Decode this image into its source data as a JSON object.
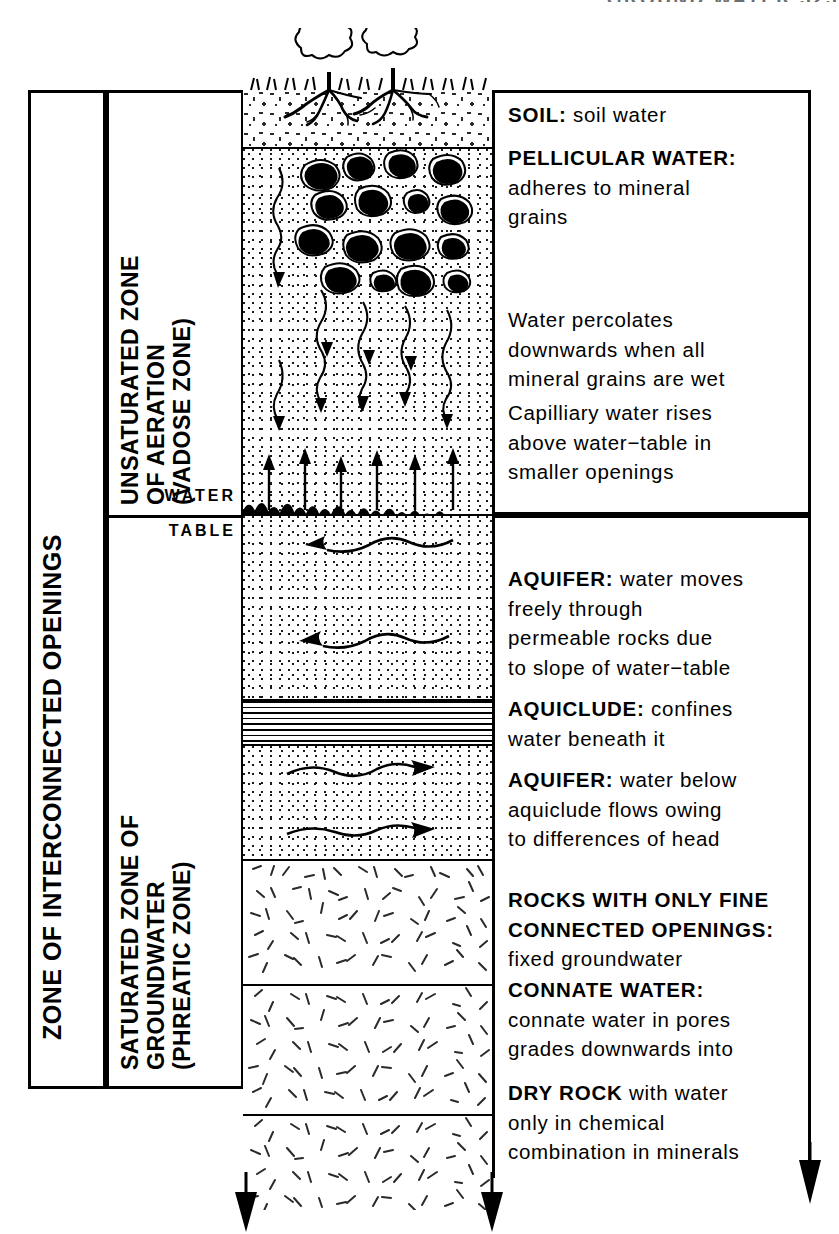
{
  "top_caption": "GROUND WATER 323",
  "frame_labels": {
    "interconnected": "ZONE OF INTERCONNECTED OPENINGS",
    "unsaturated_l1": "UNSATURATED ZONE",
    "unsaturated_l2": "OF AERATION",
    "unsaturated_l3": "(VADOSE ZONE)",
    "saturated_l1": "SATURATED ZONE OF",
    "saturated_l2": "GROUNDWATER",
    "saturated_l3": "(PHREATIC ZONE)",
    "water_table_line1": "WATER",
    "water_table_line2": "TABLE"
  },
  "column_layers": [
    {
      "name": "soil",
      "label": "SOIL",
      "fill": "soil",
      "top": 0,
      "height": 58
    },
    {
      "name": "pellicular",
      "label": "PELLICULAR WATER ZONE",
      "fill": "stipple",
      "top": 58,
      "height": 170
    },
    {
      "name": "percolation",
      "label": "PERCOLATION ZONE",
      "fill": "stipple",
      "top": 228,
      "height": 140
    },
    {
      "name": "capillary-fringe",
      "label": "CAPILLARY FRINGE",
      "fill": "stipple",
      "top": 368,
      "height": 57
    },
    {
      "name": "aquifer-upper",
      "label": "UPPER AQUIFER",
      "fill": "stipple",
      "top": 425,
      "height": 185
    },
    {
      "name": "aquiclude",
      "label": "AQUICLUDE",
      "fill": "lined",
      "top": 610,
      "height": 45
    },
    {
      "name": "aquifer-lower",
      "label": "LOWER AQUIFER",
      "fill": "stipple",
      "top": 655,
      "height": 115
    },
    {
      "name": "fine-connected",
      "label": "ROCKS WITH FINE OPENINGS",
      "fill": "hatch",
      "top": 770,
      "height": 125
    },
    {
      "name": "connate",
      "label": "CONNATE WATER ROCK",
      "fill": "hatch",
      "top": 895,
      "height": 130
    },
    {
      "name": "dry-rock",
      "label": "DRY ROCK",
      "fill": "hatch",
      "top": 1025,
      "height": 95
    }
  ],
  "descriptions": [
    {
      "id": "soil",
      "top": 100,
      "head": "SOIL:",
      "body": " soil water"
    },
    {
      "id": "pellicular",
      "top": 143,
      "head": "PELLICULAR WATER:",
      "body": "\nadheres to mineral\ngrains"
    },
    {
      "id": "percolation",
      "top": 305,
      "head": "",
      "body": "Water percolates\ndownwards when all\nmineral grains are wet"
    },
    {
      "id": "capillary",
      "top": 398,
      "head": "",
      "body": "Capilliary water rises\nabove water−table in\nsmaller openings"
    },
    {
      "id": "aquifer-upper",
      "top": 564,
      "head": "AQUIFER:",
      "body": " water moves\nfreely through\npermeable rocks due\nto slope of water−table"
    },
    {
      "id": "aquiclude",
      "top": 694,
      "head": "AQUICLUDE:",
      "body": " confines\nwater beneath it"
    },
    {
      "id": "aquifer-lower",
      "top": 765,
      "head": "AQUIFER:",
      "body": " water below\naquiclude flows owing\nto differences of head"
    },
    {
      "id": "fine-connected",
      "top": 885,
      "head": "ROCKS WITH ONLY FINE\nCONNECTED OPENINGS:",
      "body": "\nfixed groundwater"
    },
    {
      "id": "connate",
      "top": 975,
      "head": "CONNATE WATER:",
      "body": "\nconnate water in pores\ngrades downwards into"
    },
    {
      "id": "dry-rock",
      "top": 1078,
      "head": "DRY ROCK",
      "body": " with water\nonly in chemical\ncombination in minerals"
    }
  ],
  "colors": {
    "ink": "#000000",
    "paper": "#ffffff",
    "caption_grey": "#6d6d6d"
  }
}
